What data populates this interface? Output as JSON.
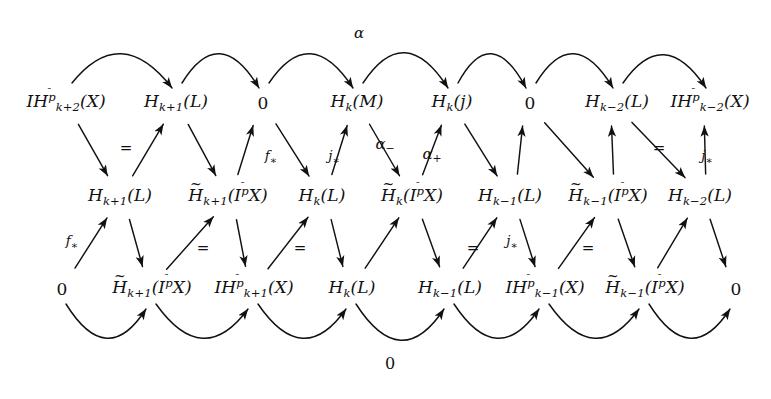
{
  "figure": {
    "kind": "commutative-braid-diagram",
    "width": 771,
    "height": 399,
    "background": "#ffffff",
    "ink": "#111111"
  },
  "rows": {
    "top": {
      "y": 103,
      "nodes": [
        {
          "id": "t1",
          "x": 66,
          "text": "IH",
          "sup": "p̄",
          "sub": "k+2",
          "arg": "(X)",
          "kind": "IH"
        },
        {
          "id": "t2",
          "x": 176,
          "text": "H",
          "sub": "k+1",
          "arg": "(L)",
          "kind": "H"
        },
        {
          "id": "t3",
          "x": 263,
          "text": "0",
          "kind": "zero"
        },
        {
          "id": "t4",
          "x": 357,
          "text": "H",
          "sub": "k",
          "arg": "(M)",
          "kind": "H"
        },
        {
          "id": "t5",
          "x": 452,
          "text": "H",
          "sub": "k",
          "arg": "(j)",
          "kind": "H"
        },
        {
          "id": "t6",
          "x": 530,
          "text": "0",
          "kind": "zero"
        },
        {
          "id": "t7",
          "x": 617,
          "text": "H",
          "sub": "k−2",
          "arg": "(L)",
          "kind": "H"
        },
        {
          "id": "t8",
          "x": 710,
          "text": "IH",
          "sup": "p̄",
          "sub": "k−2",
          "arg": "(X)",
          "kind": "IH"
        }
      ]
    },
    "middle": {
      "y": 197,
      "nodes": [
        {
          "id": "m1",
          "x": 120,
          "text": "H",
          "sub": "k+1",
          "arg": "(L)",
          "kind": "H"
        },
        {
          "id": "m2",
          "x": 228,
          "text": "H̃",
          "sub": "k+1",
          "arg": "(I^p̄ X)",
          "kind": "Htilde"
        },
        {
          "id": "m3",
          "x": 322,
          "text": "H",
          "sub": "k",
          "arg": "(L)",
          "kind": "H"
        },
        {
          "id": "m4",
          "x": 412,
          "text": "H̃",
          "sub": "k",
          "arg": "(I^p̄ X)",
          "kind": "Htilde"
        },
        {
          "id": "m5",
          "x": 510,
          "text": "H",
          "sub": "k−1",
          "arg": "(L)",
          "kind": "H"
        },
        {
          "id": "m6",
          "x": 608,
          "text": "H̃",
          "sub": "k−1",
          "arg": "(I^p̄ X)",
          "kind": "Htilde"
        },
        {
          "id": "m7",
          "x": 700,
          "text": "H",
          "sub": "k−2",
          "arg": "(L)",
          "kind": "H"
        }
      ]
    },
    "bottom": {
      "y": 289,
      "nodes": [
        {
          "id": "b1",
          "x": 62,
          "text": "0",
          "kind": "zero"
        },
        {
          "id": "b2",
          "x": 152,
          "text": "H̃",
          "sub": "k+1",
          "arg": "(I^p̄ X)",
          "kind": "Htilde"
        },
        {
          "id": "b3",
          "x": 254,
          "text": "IH",
          "sup": "p̄",
          "sub": "k+1",
          "arg": "(X)",
          "kind": "IH"
        },
        {
          "id": "b4",
          "x": 352,
          "text": "H",
          "sub": "k",
          "arg": "(L)",
          "kind": "H"
        },
        {
          "id": "b5",
          "x": 450,
          "text": "H",
          "sub": "k−1",
          "arg": "(L)",
          "kind": "H"
        },
        {
          "id": "b6",
          "x": 545,
          "text": "IH",
          "sup": "p̄",
          "sub": "k−1",
          "arg": "(X)",
          "kind": "IH"
        },
        {
          "id": "b7",
          "x": 645,
          "text": "H̃",
          "sub": "k−1",
          "arg": "(I^p̄ X)",
          "kind": "Htilde"
        },
        {
          "id": "b8",
          "x": 736,
          "text": "0",
          "kind": "zero"
        }
      ]
    }
  },
  "arrow_labels": [
    {
      "id": "al-alpha",
      "x": 359,
      "y": 33,
      "text": "α",
      "style": "greek"
    },
    {
      "id": "al-eq-1",
      "x": 126,
      "y": 148,
      "text": "=",
      "style": "eq"
    },
    {
      "id": "al-fstar-1",
      "x": 271,
      "y": 158,
      "text": "f∗",
      "style": "star"
    },
    {
      "id": "al-jstar-1",
      "x": 334,
      "y": 158,
      "text": "j∗",
      "style": "star"
    },
    {
      "id": "al-alpha-minus",
      "x": 385,
      "y": 146,
      "text": "α−",
      "style": "greek"
    },
    {
      "id": "al-alpha-plus",
      "x": 432,
      "y": 156,
      "text": "α+",
      "style": "greek"
    },
    {
      "id": "al-eq-2",
      "x": 659,
      "y": 148,
      "text": "=",
      "style": "eq"
    },
    {
      "id": "al-jstar-2",
      "x": 707,
      "y": 158,
      "text": "j∗",
      "style": "star"
    },
    {
      "id": "al-fstar-2",
      "x": 72,
      "y": 243,
      "text": "f∗",
      "style": "star"
    },
    {
      "id": "al-eq-3",
      "x": 203,
      "y": 248,
      "text": "=",
      "style": "eq"
    },
    {
      "id": "al-eq-4",
      "x": 300,
      "y": 248,
      "text": "=",
      "style": "eq"
    },
    {
      "id": "al-eq-5",
      "x": 473,
      "y": 248,
      "text": "=",
      "style": "eq"
    },
    {
      "id": "al-jstar-3",
      "x": 512,
      "y": 243,
      "text": "j∗",
      "style": "star"
    },
    {
      "id": "al-eq-6",
      "x": 588,
      "y": 248,
      "text": "=",
      "style": "eq"
    },
    {
      "id": "al-zero-bot",
      "x": 390,
      "y": 364,
      "text": "0",
      "style": "zerolbl"
    }
  ],
  "arcs": {
    "top_curves": [
      {
        "from": 66,
        "to": 176,
        "apex_y": 40,
        "hook": false
      },
      {
        "from": 176,
        "to": 263,
        "apex_y": 40,
        "hook": false
      },
      {
        "from": 263,
        "to": 357,
        "apex_y": 40,
        "hook": false
      },
      {
        "from": 357,
        "to": 452,
        "apex_y": 38,
        "hook": false
      },
      {
        "from": 452,
        "to": 530,
        "apex_y": 40,
        "hook": false
      },
      {
        "from": 530,
        "to": 617,
        "apex_y": 40,
        "hook": false
      },
      {
        "from": 617,
        "to": 710,
        "apex_y": 42,
        "hook": false
      }
    ],
    "bottom_curves": [
      {
        "from": 62,
        "to": 152,
        "apex_y": 352
      },
      {
        "from": 152,
        "to": 254,
        "apex_y": 352
      },
      {
        "from": 254,
        "to": 352,
        "apex_y": 352
      },
      {
        "from": 352,
        "to": 450,
        "apex_y": 356
      },
      {
        "from": 450,
        "to": 545,
        "apex_y": 352
      },
      {
        "from": 545,
        "to": 645,
        "apex_y": 352
      },
      {
        "from": 645,
        "to": 736,
        "apex_y": 352
      }
    ]
  }
}
